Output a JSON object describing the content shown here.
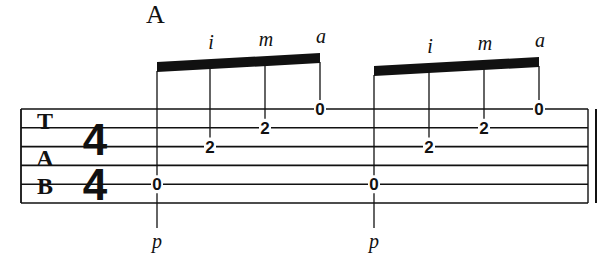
{
  "section": {
    "label": "A"
  },
  "tab": {
    "clef_letters": [
      "T",
      "A",
      "B"
    ],
    "time_signature": {
      "top": "4",
      "bottom": "4"
    },
    "string_count": 6,
    "staff": {
      "left": 21,
      "right": 588,
      "top": 109,
      "spacing": 18.8,
      "end_barline": "final-double"
    },
    "groups": [
      {
        "beam": {
          "x1": 157,
          "x2": 320,
          "y_left": 62,
          "y_right": 53,
          "thickness": 10
        },
        "notes": [
          {
            "x": 157,
            "string": 5,
            "fret": "0",
            "finger": "p",
            "finger_position": "below"
          },
          {
            "x": 210,
            "string": 3,
            "fret": "2",
            "finger": "i",
            "finger_position": "above"
          },
          {
            "x": 265,
            "string": 2,
            "fret": "2",
            "finger": "m",
            "finger_position": "above"
          },
          {
            "x": 320,
            "string": 1,
            "fret": "0",
            "finger": "a",
            "finger_position": "above"
          }
        ]
      },
      {
        "beam": {
          "x1": 374,
          "x2": 539,
          "y_left": 66,
          "y_right": 57,
          "thickness": 10
        },
        "notes": [
          {
            "x": 374,
            "string": 5,
            "fret": "0",
            "finger": "p",
            "finger_position": "below"
          },
          {
            "x": 429,
            "string": 3,
            "fret": "2",
            "finger": "i",
            "finger_position": "above"
          },
          {
            "x": 484,
            "string": 2,
            "fret": "2",
            "finger": "m",
            "finger_position": "above"
          },
          {
            "x": 539,
            "string": 1,
            "fret": "0",
            "finger": "a",
            "finger_position": "above"
          }
        ]
      }
    ]
  },
  "colors": {
    "ink": "#111111",
    "paper": "#ffffff"
  }
}
